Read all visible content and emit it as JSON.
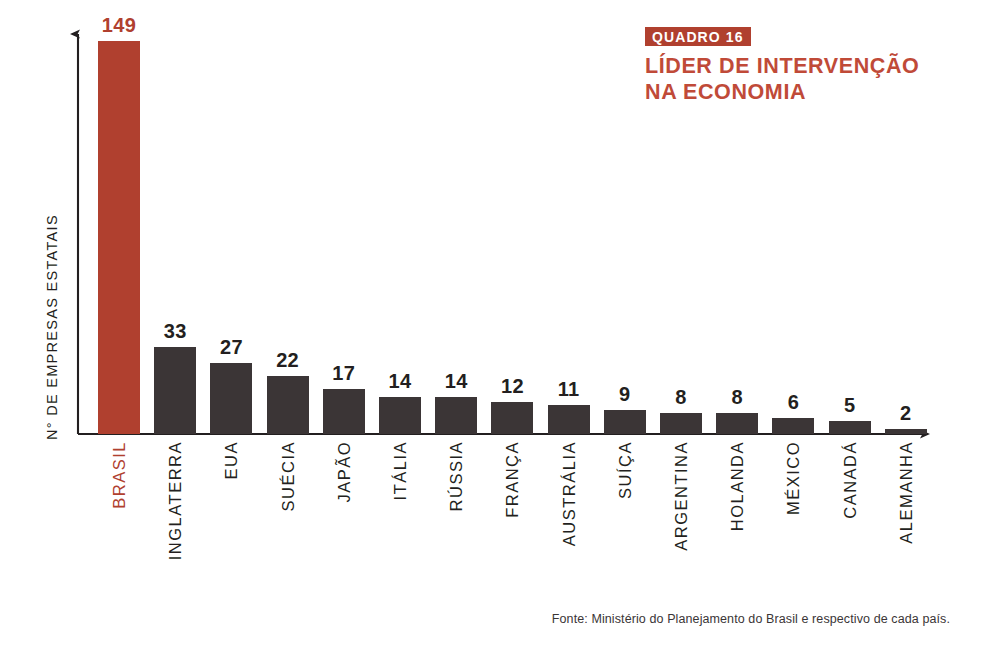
{
  "header": {
    "badge": "QUADRO 16",
    "title_line1": "LÍDER DE INTERVENÇÃO",
    "title_line2": "NA ECONOMIA"
  },
  "axis": {
    "y_label": "N° DE EMPRESAS ESTATAIS"
  },
  "source": {
    "text": "Fonte: Ministério do Planejamento do Brasil e respectivo de cada país."
  },
  "colors": {
    "highlight": "#b0402f",
    "bar": "#3b3536",
    "text": "#231f20",
    "title": "#c04a38",
    "background": "#ffffff"
  },
  "chart_data": {
    "type": "bar",
    "title": "LÍDER DE INTERVENÇÃO NA ECONOMIA",
    "subtitle": "QUADRO 16",
    "xlabel": "",
    "ylabel": "N° DE EMPRESAS ESTATAIS",
    "ylim": [
      0,
      149
    ],
    "grid": false,
    "legend": false,
    "highlight_category": "BRASIL",
    "source": "Fonte: Ministério do Planejamento do Brasil e respectivo de cada país.",
    "categories": [
      "BRASIL",
      "INGLATERRA",
      "EUA",
      "SUÉCIA",
      "JAPÃO",
      "ITÁLIA",
      "RÚSSIA",
      "FRANÇA",
      "AUSTRÁLIA",
      "SUÍÇA",
      "ARGENTINA",
      "HOLANDA",
      "MÉXICO",
      "CANADÁ",
      "ALEMANHA"
    ],
    "values": [
      149,
      33,
      27,
      22,
      17,
      14,
      14,
      12,
      11,
      9,
      8,
      8,
      6,
      5,
      2
    ],
    "bars": [
      {
        "label": "BRASIL",
        "value": 149,
        "value_text": "149",
        "highlight": true
      },
      {
        "label": "INGLATERRA",
        "value": 33,
        "value_text": "33",
        "highlight": false
      },
      {
        "label": "EUA",
        "value": 27,
        "value_text": "27",
        "highlight": false
      },
      {
        "label": "SUÉCIA",
        "value": 22,
        "value_text": "22",
        "highlight": false
      },
      {
        "label": "JAPÃO",
        "value": 17,
        "value_text": "17",
        "highlight": false
      },
      {
        "label": "ITÁLIA",
        "value": 14,
        "value_text": "14",
        "highlight": false
      },
      {
        "label": "RÚSSIA",
        "value": 14,
        "value_text": "14",
        "highlight": false
      },
      {
        "label": "FRANÇA",
        "value": 12,
        "value_text": "12",
        "highlight": false
      },
      {
        "label": "AUSTRÁLIA",
        "value": 11,
        "value_text": "11",
        "highlight": false
      },
      {
        "label": "SUÍÇA",
        "value": 9,
        "value_text": "9",
        "highlight": false
      },
      {
        "label": "ARGENTINA",
        "value": 8,
        "value_text": "8",
        "highlight": false
      },
      {
        "label": "HOLANDA",
        "value": 8,
        "value_text": "8",
        "highlight": false
      },
      {
        "label": "MÉXICO",
        "value": 6,
        "value_text": "6",
        "highlight": false
      },
      {
        "label": "CANADÁ",
        "value": 5,
        "value_text": "5",
        "highlight": false
      },
      {
        "label": "ALEMANHA",
        "value": 2,
        "value_text": "2",
        "highlight": false
      }
    ]
  }
}
